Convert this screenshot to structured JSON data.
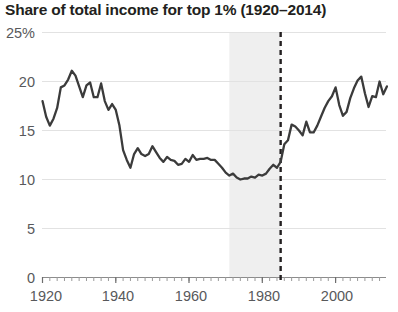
{
  "chart_data": {
    "type": "line",
    "title": "Share of total income for top 1% (1920–2014)",
    "xlabel": "",
    "ylabel": "",
    "xlim": [
      1920,
      2014
    ],
    "ylim": [
      0,
      25
    ],
    "grid": true,
    "legend": "none",
    "y_ticks": [
      0,
      5,
      10,
      15,
      20,
      25
    ],
    "y_tick_labels": [
      "0",
      "5",
      "10",
      "15",
      "20",
      "25%"
    ],
    "x_ticks": [
      1920,
      1940,
      1960,
      1980,
      2000
    ],
    "x_tick_labels": [
      "1920",
      "1940",
      "1960",
      "1980",
      "2000"
    ],
    "line_color": "#3b3b3b",
    "shade_color": "#efefef",
    "annotations": [
      {
        "kind": "vertical-dashed-line",
        "x": 1985,
        "color": "#231f20"
      },
      {
        "kind": "shaded-band",
        "x_start": 1971,
        "x_end": 1985,
        "color": "#efefef"
      }
    ],
    "series": [
      {
        "name": "Top 1% income share",
        "x": [
          1920,
          1921,
          1922,
          1923,
          1924,
          1925,
          1926,
          1927,
          1928,
          1929,
          1930,
          1931,
          1932,
          1933,
          1934,
          1935,
          1936,
          1937,
          1938,
          1939,
          1940,
          1941,
          1942,
          1943,
          1944,
          1945,
          1946,
          1947,
          1948,
          1949,
          1950,
          1951,
          1952,
          1953,
          1954,
          1955,
          1956,
          1957,
          1958,
          1959,
          1960,
          1961,
          1962,
          1963,
          1964,
          1965,
          1966,
          1967,
          1968,
          1969,
          1970,
          1971,
          1972,
          1973,
          1974,
          1975,
          1976,
          1977,
          1978,
          1979,
          1980,
          1981,
          1982,
          1983,
          1984,
          1985,
          1986,
          1987,
          1988,
          1989,
          1990,
          1991,
          1992,
          1993,
          1994,
          1995,
          1996,
          1997,
          1998,
          1999,
          2000,
          2001,
          2002,
          2003,
          2004,
          2005,
          2006,
          2007,
          2008,
          2009,
          2010,
          2011,
          2012,
          2013,
          2014
        ],
        "values": [
          18.0,
          16.4,
          15.5,
          16.2,
          17.3,
          19.4,
          19.6,
          20.2,
          21.1,
          20.6,
          19.5,
          18.4,
          19.6,
          19.9,
          18.4,
          18.4,
          19.8,
          18.0,
          17.1,
          17.7,
          17.1,
          15.5,
          13.0,
          12.0,
          11.2,
          12.6,
          13.2,
          12.6,
          12.4,
          12.6,
          13.4,
          12.8,
          12.2,
          11.8,
          12.3,
          12.0,
          11.9,
          11.5,
          11.6,
          12.1,
          11.8,
          12.5,
          12.0,
          12.1,
          12.1,
          12.2,
          12.0,
          12.0,
          11.6,
          11.2,
          10.7,
          10.4,
          10.6,
          10.2,
          10.0,
          10.1,
          10.1,
          10.3,
          10.2,
          10.5,
          10.4,
          10.6,
          11.1,
          11.5,
          11.2,
          11.8,
          13.6,
          14.0,
          15.6,
          15.4,
          15.0,
          14.5,
          15.9,
          14.8,
          14.8,
          15.5,
          16.4,
          17.3,
          18.0,
          18.5,
          19.4,
          17.6,
          16.5,
          16.9,
          18.3,
          19.3,
          20.1,
          20.5,
          18.8,
          17.4,
          18.5,
          18.4,
          20.0,
          18.7,
          19.5
        ]
      }
    ]
  },
  "axis": {
    "y_label_25": "25%",
    "y_label_20": "20",
    "y_label_15": "15",
    "y_label_10": "10",
    "y_label_5": "5",
    "y_label_0": "0",
    "x_label_1920": "1920",
    "x_label_1940": "1940",
    "x_label_1960": "1960",
    "x_label_1980": "1980",
    "x_label_2000": "2000"
  }
}
